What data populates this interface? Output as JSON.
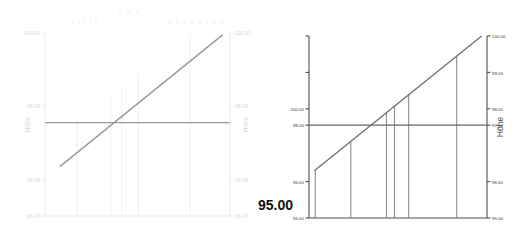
{
  "meta": {
    "callout_value": "95.00",
    "watermark_title": "X X X",
    "watermark_sub_left": "t t t t t",
    "watermark_sub_right": "x x x x x x x x",
    "watermark_footer": "x x x x  x x x"
  },
  "colors": {
    "faint_axis": "#e6e6e6",
    "faint_text": "#d8d8d8",
    "faint_line": "#9a9a9a",
    "dark_axis": "#4d4d4d",
    "dark_text": "#3a3a3a",
    "dark_line": "#6a6a6a",
    "drop_line": "#777777",
    "reference_line": "#666666",
    "background": "#ffffff"
  },
  "chart_data": [
    {
      "id": "chart-left",
      "type": "line",
      "title": "",
      "xlabel": "",
      "ylabel": "Höhe",
      "ylabel_left": "Höhe",
      "ylabel_right": "Höhe",
      "ylim": [
        95.0,
        100.0
      ],
      "yticks": [
        95.0,
        96.0,
        98.0,
        100.0
      ],
      "ytick_labels": [
        "95.00",
        "96.00",
        "98.00",
        "100.00"
      ],
      "ytick_labels_right": [
        "95.00",
        "96.00",
        "98.00",
        "100.00"
      ],
      "grid": false,
      "style": "faint",
      "series": [
        {
          "name": "Gelaendeprofil",
          "type": "line",
          "x": [
            0.08,
            0.96
          ],
          "y": [
            96.35,
            99.95
          ]
        },
        {
          "name": "Referenzhoehe",
          "type": "hline",
          "y": 97.55
        }
      ],
      "drop_lines": [
        {
          "x": 0.175,
          "y_top": 97.55,
          "y_bottom": 95.0
        },
        {
          "x": 0.355,
          "y_top": 98.3,
          "y_bottom": 95.0
        },
        {
          "x": 0.415,
          "y_top": 98.55,
          "y_bottom": 95.0
        },
        {
          "x": 0.505,
          "y_top": 98.9,
          "y_bottom": 95.0
        },
        {
          "x": 0.785,
          "y_top": 100.0,
          "y_bottom": 95.0
        }
      ]
    },
    {
      "id": "chart-right",
      "type": "line",
      "title": "",
      "xlabel": "",
      "ylabel": "Höhe",
      "ylabel_right": "Höhe",
      "ylim": [
        95.0,
        100.0
      ],
      "yticks": [
        95.0,
        96.0,
        97.55,
        98.0,
        99.0,
        100.0
      ],
      "ytick_labels": [
        "95.00",
        "96.00",
        "98.00",
        "100.00"
      ],
      "ytick_labels_right": [
        "95.00",
        "96.00",
        "97.00",
        "98.00",
        "99.00",
        "100.00"
      ],
      "grid": false,
      "style": "dark",
      "series": [
        {
          "name": "Gelaendeprofil",
          "type": "line",
          "x": [
            0.03,
            0.97
          ],
          "y": [
            96.3,
            100.0
          ]
        },
        {
          "name": "Referenzhoehe",
          "type": "hline",
          "y": 97.55
        }
      ],
      "drop_lines": [
        {
          "x": 0.035,
          "y_top": 96.3,
          "y_bottom": 95.0
        },
        {
          "x": 0.235,
          "y_top": 97.1,
          "y_bottom": 95.0
        },
        {
          "x": 0.435,
          "y_top": 97.9,
          "y_bottom": 95.0
        },
        {
          "x": 0.48,
          "y_top": 98.1,
          "y_bottom": 95.0
        },
        {
          "x": 0.56,
          "y_top": 98.4,
          "y_bottom": 95.0
        },
        {
          "x": 0.83,
          "y_top": 99.45,
          "y_bottom": 95.0
        }
      ]
    }
  ]
}
